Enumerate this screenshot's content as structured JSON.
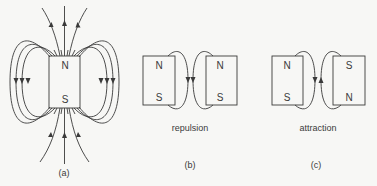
{
  "figure": {
    "panel_a": {
      "north_label": "N",
      "south_label": "S",
      "caption": "(a)"
    },
    "panel_b": {
      "left_magnet": {
        "top_label": "N",
        "bottom_label": "S"
      },
      "right_magnet": {
        "top_label": "N",
        "bottom_label": "S"
      },
      "description": "repulsion",
      "caption": "(b)"
    },
    "panel_c": {
      "left_magnet": {
        "top_label": "N",
        "bottom_label": "S"
      },
      "right_magnet": {
        "top_label": "S",
        "bottom_label": "N"
      },
      "description": "attraction",
      "caption": "(c)"
    },
    "colors": {
      "line": "#3a3a3a",
      "background": "#f7f7f5"
    }
  }
}
